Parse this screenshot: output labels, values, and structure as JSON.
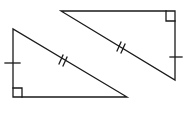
{
  "diagram": {
    "type": "congruent-right-triangles",
    "stroke_color": "#1a1a1a",
    "background_color": "#ffffff",
    "triangles": [
      {
        "id": "left-triangle",
        "right_angle_at": "bottom-left",
        "marked_leg": "vertical",
        "leg_ticks": 1,
        "hypotenuse_ticks": 2
      },
      {
        "id": "right-triangle",
        "right_angle_at": "top-right",
        "marked_leg": "vertical",
        "leg_ticks": 1,
        "hypotenuse_ticks": 2
      }
    ]
  }
}
